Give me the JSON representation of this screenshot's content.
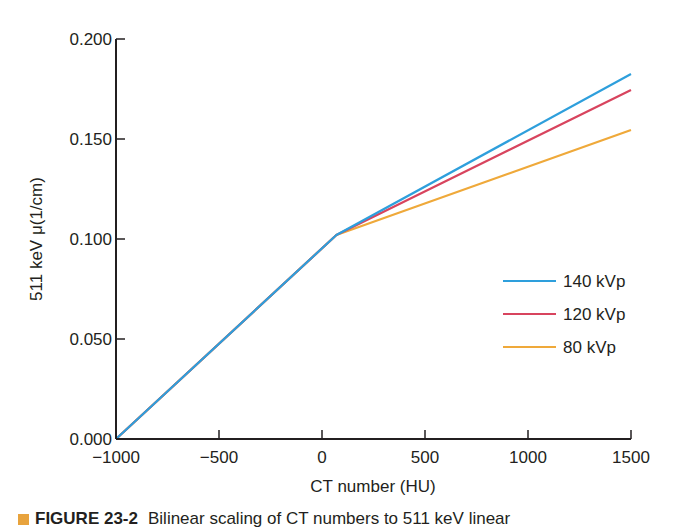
{
  "chart_data": {
    "type": "line",
    "title": "",
    "xlabel": "CT number (HU)",
    "ylabel": "511 keV μ(1/cm)",
    "xlim": [
      -1000,
      1500
    ],
    "ylim": [
      0.0,
      0.2
    ],
    "grid": false,
    "legend_position": "right-middle",
    "x_ticks": [
      -1000,
      -500,
      0,
      500,
      1000,
      1500
    ],
    "x_tick_labels": [
      "−1000",
      "−500",
      "0",
      "500",
      "1000",
      "1500"
    ],
    "y_ticks": [
      0.0,
      0.05,
      0.1,
      0.15,
      0.2
    ],
    "y_tick_labels": [
      "0.000",
      "0.050",
      "0.100",
      "0.150",
      "0.200"
    ],
    "series": [
      {
        "name": "140 kVp",
        "color": "#2e9fdc",
        "x": [
          -1000,
          70,
          1500
        ],
        "y": [
          0.0,
          0.102,
          0.1825
        ]
      },
      {
        "name": "120 kVp",
        "color": "#d8445e",
        "x": [
          -1000,
          70,
          1500
        ],
        "y": [
          0.0,
          0.102,
          0.1745
        ]
      },
      {
        "name": "80 kVp",
        "color": "#efa93a",
        "x": [
          -1000,
          70,
          1500
        ],
        "y": [
          0.0,
          0.102,
          0.1545
        ]
      }
    ]
  },
  "caption": {
    "marker_color": "#e8a33d",
    "figure_label": "FIGURE 23-2",
    "text": "Bilinear scaling of CT numbers to 511 keV linear"
  }
}
